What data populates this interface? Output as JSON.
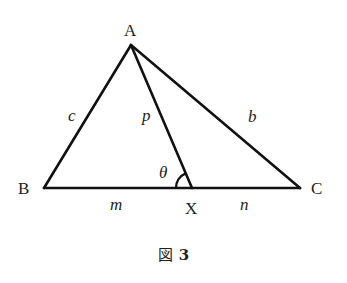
{
  "figure": {
    "caption_prefix": "図",
    "caption_number": "3",
    "vertices": {
      "A": {
        "label": "A",
        "x": 131,
        "y": 45
      },
      "B": {
        "label": "B",
        "x": 44,
        "y": 188
      },
      "C": {
        "label": "C",
        "x": 300,
        "y": 188
      },
      "X": {
        "label": "X",
        "x": 192,
        "y": 188
      }
    },
    "segments": [
      {
        "from": "A",
        "to": "B",
        "label": "c"
      },
      {
        "from": "A",
        "to": "C",
        "label": "b"
      },
      {
        "from": "A",
        "to": "X",
        "label": "p"
      },
      {
        "from": "B",
        "to": "X",
        "label": "m"
      },
      {
        "from": "X",
        "to": "C",
        "label": "n"
      }
    ],
    "angle": {
      "label": "θ",
      "at": "X",
      "between": [
        "A",
        "B"
      ]
    },
    "line_color": "#111111",
    "text_color": "#222222"
  }
}
